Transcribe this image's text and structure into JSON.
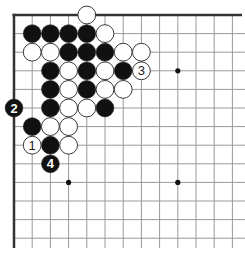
{
  "board": {
    "origin": {
      "x": 14,
      "y": 15
    },
    "spacing": {
      "x": 18.2,
      "y": 18.6
    },
    "columns": 13,
    "rows": 13,
    "extent": {
      "right": 245,
      "bottom": 248
    },
    "top_edge": true,
    "left_edge": true,
    "colors": {
      "line": "#999999",
      "edge": "#333333",
      "black": "#111111",
      "white": "#ffffff",
      "stone_outline": "#222222"
    }
  },
  "star_points": [
    {
      "col": 9,
      "row": 3
    },
    {
      "col": 3,
      "row": 9
    },
    {
      "col": 9,
      "row": 9
    }
  ],
  "stones": [
    {
      "col": 4,
      "row": 0,
      "color": "white"
    },
    {
      "col": 1,
      "row": 1,
      "color": "black"
    },
    {
      "col": 2,
      "row": 1,
      "color": "black"
    },
    {
      "col": 3,
      "row": 1,
      "color": "black"
    },
    {
      "col": 4,
      "row": 1,
      "color": "black"
    },
    {
      "col": 5,
      "row": 1,
      "color": "white"
    },
    {
      "col": 1,
      "row": 2,
      "color": "white"
    },
    {
      "col": 2,
      "row": 2,
      "color": "white"
    },
    {
      "col": 3,
      "row": 2,
      "color": "black"
    },
    {
      "col": 4,
      "row": 2,
      "color": "black"
    },
    {
      "col": 5,
      "row": 2,
      "color": "black"
    },
    {
      "col": 6,
      "row": 2,
      "color": "white"
    },
    {
      "col": 7,
      "row": 2,
      "color": "white"
    },
    {
      "col": 2,
      "row": 3,
      "color": "black"
    },
    {
      "col": 3,
      "row": 3,
      "color": "white"
    },
    {
      "col": 4,
      "row": 3,
      "color": "black"
    },
    {
      "col": 5,
      "row": 3,
      "color": "white"
    },
    {
      "col": 6,
      "row": 3,
      "color": "black"
    },
    {
      "col": 7,
      "row": 3,
      "color": "white",
      "label": "3"
    },
    {
      "col": 2,
      "row": 4,
      "color": "black"
    },
    {
      "col": 3,
      "row": 4,
      "color": "white"
    },
    {
      "col": 4,
      "row": 4,
      "color": "black"
    },
    {
      "col": 5,
      "row": 4,
      "color": "white"
    },
    {
      "col": 6,
      "row": 4,
      "color": "white"
    },
    {
      "col": 0,
      "row": 5,
      "color": "black",
      "label": "2"
    },
    {
      "col": 2,
      "row": 5,
      "color": "black"
    },
    {
      "col": 3,
      "row": 5,
      "color": "white"
    },
    {
      "col": 4,
      "row": 5,
      "color": "white"
    },
    {
      "col": 5,
      "row": 5,
      "color": "black"
    },
    {
      "col": 1,
      "row": 6,
      "color": "black"
    },
    {
      "col": 2,
      "row": 6,
      "color": "white"
    },
    {
      "col": 3,
      "row": 6,
      "color": "white"
    },
    {
      "col": 1,
      "row": 7,
      "color": "white",
      "label": "1"
    },
    {
      "col": 2,
      "row": 7,
      "color": "black"
    },
    {
      "col": 3,
      "row": 7,
      "color": "white"
    },
    {
      "col": 2,
      "row": 8,
      "color": "black",
      "label": "4"
    }
  ]
}
